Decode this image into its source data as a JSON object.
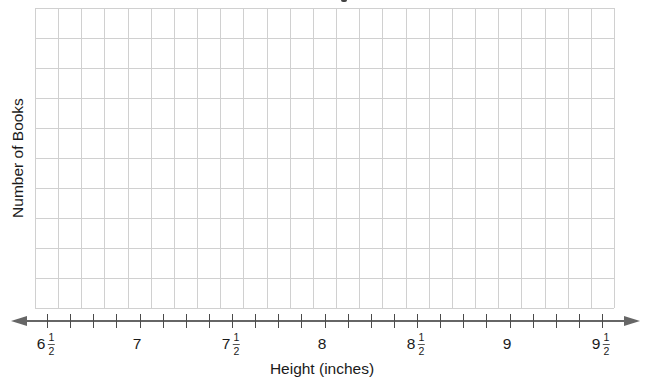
{
  "chart": {
    "ylabel": "Number of Books",
    "xlabel": "Height (inches)",
    "colors": {
      "grid": "#d0d0d0",
      "axis": "#666666",
      "text": "#1a1a1a"
    },
    "tick_labels": [
      {
        "whole": "6",
        "num": "1",
        "den": "2"
      },
      {
        "whole": "7",
        "num": "",
        "den": ""
      },
      {
        "whole": "7",
        "num": "1",
        "den": "2"
      },
      {
        "whole": "8",
        "num": "",
        "den": ""
      },
      {
        "whole": "8",
        "num": "1",
        "den": "2"
      },
      {
        "whole": "9",
        "num": "",
        "den": ""
      },
      {
        "whole": "9",
        "num": "1",
        "den": "2"
      }
    ]
  },
  "chart_data": {
    "type": "scatter",
    "subtype": "line plot (dot plot) — blank template",
    "title": "",
    "xlabel": "Height (inches)",
    "ylabel": "Number of Books",
    "xlim": [
      6.5,
      9.5
    ],
    "x_tick_step": 0.125,
    "x_major_ticks": [
      6.5,
      7,
      7.5,
      8,
      8.5,
      9,
      9.5
    ],
    "x_tick_labels": [
      "6 1/2",
      "7",
      "7 1/2",
      "8",
      "8 1/2",
      "9",
      "9 1/2"
    ],
    "grid": {
      "on": true,
      "rows": 10,
      "columns": 25
    },
    "y_tick_labels": [],
    "legend": null,
    "x": [],
    "values": []
  }
}
